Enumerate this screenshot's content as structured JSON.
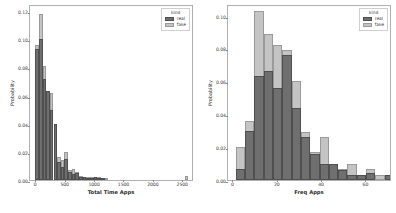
{
  "figure": {
    "background": "#ffffff",
    "panels": [
      "left",
      "right"
    ]
  },
  "legend": {
    "title": "kind",
    "entries": [
      {
        "label": "real",
        "color": "#6f6f6f"
      },
      {
        "label": "fake",
        "color": "#c4c4c4"
      }
    ]
  },
  "chart_data": [
    {
      "type": "bar",
      "subtype": "histogram-overlay",
      "title": "",
      "xlabel": "Total Time Apps",
      "ylabel": "Probability",
      "xlim": [
        -90,
        2700
      ],
      "ylim": [
        0.0,
        0.125
      ],
      "xticks": [
        0,
        500,
        1000,
        1500,
        2000,
        2500
      ],
      "xticklabels": [
        "0",
        "500",
        "1000",
        "1500",
        "2000",
        "2500"
      ],
      "yticks": [
        0.0,
        0.02,
        0.04,
        0.06,
        0.08,
        0.1,
        0.12
      ],
      "yticklabels": [
        "0.00",
        "0.02",
        "0.04",
        "0.06",
        "0.08",
        "0.10",
        "0.12"
      ],
      "grid": false,
      "legend_position": "upper right",
      "bin_width": 62,
      "bin_starts": [
        0,
        62,
        124,
        186,
        248,
        310,
        372,
        434,
        496,
        558,
        620,
        682,
        744,
        806,
        868,
        930,
        992,
        1054,
        1116,
        1178,
        1240,
        1302,
        1364,
        2542
      ],
      "series": [
        {
          "name": "fake",
          "color": "#c4c4c4",
          "values": [
            0.096,
            0.118,
            0.081,
            0.063,
            0.062,
            0.04,
            0.016,
            0.014,
            0.02,
            0.007,
            0.008,
            0.006,
            0.003,
            0.002,
            0.002,
            0.002,
            0.002,
            0.002,
            0.001,
            0.001,
            0.0,
            0.0,
            0.0,
            0.003
          ]
        },
        {
          "name": "real",
          "color": "#6f6f6f",
          "values": [
            0.093,
            0.1,
            0.072,
            0.063,
            0.05,
            0.04,
            0.013,
            0.009,
            0.015,
            0.006,
            0.004,
            0.005,
            0.002,
            0.002,
            0.001,
            0.001,
            0.002,
            0.001,
            0.001,
            0.0,
            0.0,
            0.0,
            0.0,
            0.0
          ]
        }
      ]
    },
    {
      "type": "bar",
      "subtype": "histogram-overlay",
      "title": "",
      "xlabel": "Freq Apps",
      "ylabel": "Probability",
      "xlim": [
        -2,
        72
      ],
      "ylim": [
        0.0,
        0.107
      ],
      "xticks": [
        0,
        20,
        40,
        60,
        80
      ],
      "xticklabels": [
        "0",
        "20",
        "40",
        "60",
        "80"
      ],
      "yticks": [
        0.0,
        0.02,
        0.04,
        0.06,
        0.08,
        0.1
      ],
      "yticklabels": [
        "0.00",
        "0.02",
        "0.04",
        "0.06",
        "0.08",
        "0.10"
      ],
      "grid": false,
      "legend_position": "upper right",
      "bin_width": 4.2,
      "bin_starts": [
        1.5,
        5.7,
        9.9,
        14.1,
        18.3,
        22.5,
        26.7,
        30.9,
        35.1,
        39.3,
        43.5,
        47.7,
        51.9,
        56.1,
        60.3,
        64.5,
        68.7
      ],
      "series": [
        {
          "name": "fake",
          "color": "#c4c4c4",
          "values": [
            0.02,
            0.036,
            0.103,
            0.089,
            0.082,
            0.079,
            0.06,
            0.029,
            0.017,
            0.026,
            0.01,
            0.007,
            0.01,
            0.003,
            0.007,
            0.003,
            0.0
          ]
        },
        {
          "name": "real",
          "color": "#6f6f6f",
          "values": [
            0.007,
            0.03,
            0.063,
            0.066,
            0.056,
            0.076,
            0.044,
            0.026,
            0.016,
            0.01,
            0.01,
            0.006,
            0.003,
            0.003,
            0.004,
            0.0,
            0.003
          ]
        }
      ]
    }
  ]
}
